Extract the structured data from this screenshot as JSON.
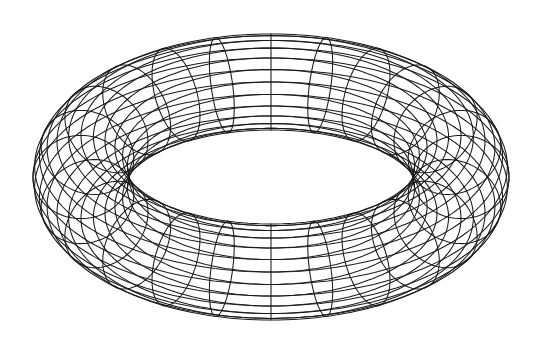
{
  "figure": {
    "background": "#ffffff",
    "stroke_color": "#1a1a1a",
    "center": [
      271,
      177
    ],
    "major_radius": 190,
    "minor_radius": 48,
    "tilt_cos": 0.5,
    "meridian_count": 24,
    "parallel_count": 24
  }
}
